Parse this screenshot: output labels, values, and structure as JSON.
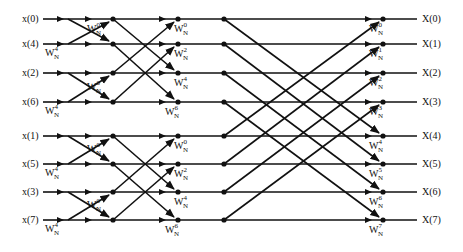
{
  "diagram": {
    "inputs": [
      "x(0)",
      "x(4)",
      "x(2)",
      "x(6)",
      "x(1)",
      "x(5)",
      "x(3)",
      "x(7)"
    ],
    "outputs": [
      "X(0)",
      "X(1)",
      "X(2)",
      "X(3)",
      "X(4)",
      "X(5)",
      "X(6)",
      "X(7)"
    ],
    "row_y": [
      19,
      44,
      73,
      102,
      136,
      164,
      192,
      220
    ],
    "stage1_twiddles": [
      {
        "base": "W",
        "sub": "N",
        "exp": "0",
        "row": 1
      },
      {
        "base": "W",
        "sub": "N",
        "exp": "4",
        "row": 1,
        "below": true
      },
      {
        "base": "W",
        "sub": "N",
        "exp": "0",
        "row": 3
      },
      {
        "base": "W",
        "sub": "N",
        "exp": "4",
        "row": 3,
        "below": true
      },
      {
        "base": "W",
        "sub": "N",
        "exp": "0",
        "row": 5
      },
      {
        "base": "W",
        "sub": "N",
        "exp": "4",
        "row": 5,
        "below": true
      },
      {
        "base": "W",
        "sub": "N",
        "exp": "0",
        "row": 7
      },
      {
        "base": "W",
        "sub": "N",
        "exp": "4",
        "row": 7,
        "below": true
      }
    ],
    "stage2_twiddles": [
      {
        "base": "W",
        "sub": "N",
        "exp": "0"
      },
      {
        "base": "W",
        "sub": "N",
        "exp": "2"
      },
      {
        "base": "W",
        "sub": "N",
        "exp": "4"
      },
      {
        "base": "W",
        "sub": "N",
        "exp": "6"
      },
      {
        "base": "W",
        "sub": "N",
        "exp": "0"
      },
      {
        "base": "W",
        "sub": "N",
        "exp": "2"
      },
      {
        "base": "W",
        "sub": "N",
        "exp": "4"
      },
      {
        "base": "W",
        "sub": "N",
        "exp": "6"
      }
    ],
    "stage3_twiddles": [
      {
        "base": "W",
        "sub": "N",
        "exp": "0"
      },
      {
        "base": "W",
        "sub": "N",
        "exp": "1"
      },
      {
        "base": "W",
        "sub": "N",
        "exp": "2"
      },
      {
        "base": "W",
        "sub": "N",
        "exp": "3"
      },
      {
        "base": "W",
        "sub": "N",
        "exp": "4"
      },
      {
        "base": "W",
        "sub": "N",
        "exp": "5"
      },
      {
        "base": "W",
        "sub": "N",
        "exp": "6"
      },
      {
        "base": "W",
        "sub": "N",
        "exp": "7"
      }
    ],
    "colors": {
      "line": "#111111",
      "text": "#111111",
      "background": "#ffffff"
    }
  }
}
